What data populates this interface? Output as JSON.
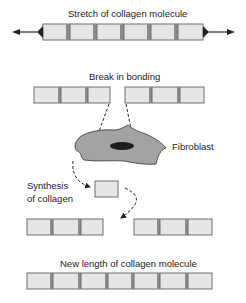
{
  "diagram": {
    "labels": {
      "stretch": "Stretch of collagen molecule",
      "break": "Break in bonding",
      "fibroblast": "Fibroblast",
      "synthesis_line1": "Synthesis",
      "synthesis_line2": "of collagen",
      "new_length": "New length of collagen molecule"
    },
    "colors": {
      "segment_fill": "#e6e6e6",
      "segment_border": "#6e6e6e",
      "link_fill": "#8c8c8c",
      "cell_fill": "#a3a3a3",
      "nucleus_fill": "#1e1e1e",
      "arrow": "#222222"
    },
    "rows": {
      "stretch_segments": 6,
      "break_left_segments": 3,
      "break_right_segments": 3,
      "rejoin_left_segments": 3,
      "rejoin_right_segments": 3,
      "synthesized_segments": 1,
      "new_length_segments": 7
    }
  }
}
